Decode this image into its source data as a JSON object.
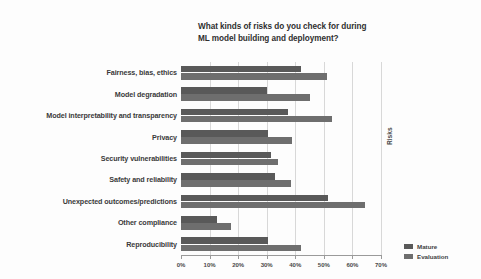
{
  "chart_data": {
    "type": "bar",
    "orientation": "horizontal",
    "title": "What kinds of risks do you check for during ML model building and deployment?",
    "title_lines": [
      "What kinds of risks do you check for during",
      "ML model building and deployment?"
    ],
    "xlabel": "",
    "ylabel": "Risks",
    "xlim": [
      0,
      70
    ],
    "xticks": [
      0,
      10,
      20,
      30,
      40,
      50,
      60,
      70
    ],
    "xtick_labels": [
      "0%",
      "10%",
      "20%",
      "30%",
      "40%",
      "50%",
      "60%",
      "70%"
    ],
    "grid": true,
    "grid_axis": "x",
    "legend_position": "bottom-right",
    "categories": [
      "Fairness, bias, ethics",
      "Model degradation",
      "Model interpretability and transparency",
      "Privacy",
      "Security vulnerabilities",
      "Safety and reliability",
      "Unexpected outcomes/predictions",
      "Other compliance",
      "Reproducibility"
    ],
    "series": [
      {
        "name": "Mature",
        "color": "#595959",
        "values": [
          42,
          30,
          37.5,
          30.5,
          31.5,
          33,
          51.5,
          12.5,
          30.5
        ]
      },
      {
        "name": "Evaluation",
        "color": "#6e6e6e",
        "values": [
          51,
          45,
          53,
          39,
          34,
          38.5,
          64.5,
          17.5,
          42
        ]
      }
    ]
  }
}
